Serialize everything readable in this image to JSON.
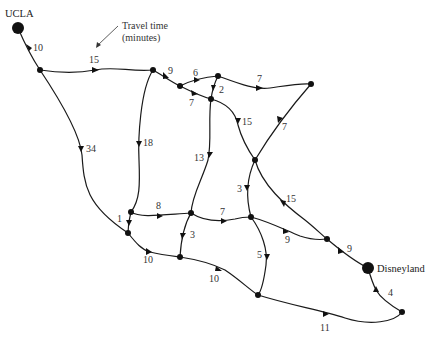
{
  "diagram": {
    "type": "directed-network",
    "annotation": {
      "text_line1": "Travel time",
      "text_line2": "(minutes)"
    },
    "terminals": {
      "source": "UCLA",
      "sink": "Disneyland"
    },
    "nodes": [
      {
        "id": "UCLA",
        "x": 18,
        "y": 28,
        "terminal": true
      },
      {
        "id": "A",
        "x": 40,
        "y": 70
      },
      {
        "id": "B",
        "x": 153,
        "y": 70
      },
      {
        "id": "C",
        "x": 180,
        "y": 86
      },
      {
        "id": "D",
        "x": 218,
        "y": 76
      },
      {
        "id": "E",
        "x": 211,
        "y": 99
      },
      {
        "id": "F",
        "x": 311,
        "y": 84
      },
      {
        "id": "G",
        "x": 255,
        "y": 160
      },
      {
        "id": "H",
        "x": 131,
        "y": 212
      },
      {
        "id": "I",
        "x": 128,
        "y": 233
      },
      {
        "id": "J",
        "x": 191,
        "y": 213
      },
      {
        "id": "K",
        "x": 180,
        "y": 257
      },
      {
        "id": "L",
        "x": 251,
        "y": 217
      },
      {
        "id": "M",
        "x": 327,
        "y": 239
      },
      {
        "id": "Disneyland",
        "x": 368,
        "y": 268,
        "terminal": true
      },
      {
        "id": "N",
        "x": 258,
        "y": 295
      },
      {
        "id": "O",
        "x": 402,
        "y": 312
      }
    ],
    "edges": [
      {
        "from": "UCLA",
        "to": "A",
        "time": "10"
      },
      {
        "from": "A",
        "to": "B",
        "time": "15"
      },
      {
        "from": "A",
        "to": "I",
        "time": "34"
      },
      {
        "from": "B",
        "to": "C",
        "time": "9"
      },
      {
        "from": "B",
        "to": "H",
        "time": "18"
      },
      {
        "from": "C",
        "to": "D",
        "time": "6"
      },
      {
        "from": "C",
        "to": "E",
        "time": "7"
      },
      {
        "from": "D",
        "to": "E",
        "time": "2"
      },
      {
        "from": "D",
        "to": "F",
        "time": "7"
      },
      {
        "from": "F",
        "to": "G",
        "time": "7"
      },
      {
        "from": "E",
        "to": "G",
        "time": "15"
      },
      {
        "from": "E",
        "to": "J",
        "time": "13"
      },
      {
        "from": "G",
        "to": "L",
        "time": "3"
      },
      {
        "from": "G",
        "to": "M",
        "time": "15"
      },
      {
        "from": "H",
        "to": "I",
        "time": "1"
      },
      {
        "from": "H",
        "to": "J",
        "time": "8"
      },
      {
        "from": "J",
        "to": "L",
        "time": "7"
      },
      {
        "from": "J",
        "to": "K",
        "time": "3"
      },
      {
        "from": "I",
        "to": "K",
        "time": "10"
      },
      {
        "from": "K",
        "to": "N",
        "time": "10"
      },
      {
        "from": "L",
        "to": "M",
        "time": "9"
      },
      {
        "from": "L",
        "to": "N",
        "time": "5"
      },
      {
        "from": "M",
        "to": "Disneyland",
        "time": "9"
      },
      {
        "from": "N",
        "to": "O",
        "time": "11"
      },
      {
        "from": "O",
        "to": "Disneyland",
        "time": "4"
      }
    ]
  },
  "labels": {
    "ucla": "UCLA",
    "disneyland": "Disneyland",
    "legend1": "Travel time",
    "legend2": "(minutes)",
    "e_ucla_a": "10",
    "e_a_b": "15",
    "e_a_i": "34",
    "e_b_c": "9",
    "e_b_h": "18",
    "e_c_d": "6",
    "e_c_e": "7",
    "e_d_e": "2",
    "e_d_f": "7",
    "e_f_g": "7",
    "e_e_g": "15",
    "e_e_j": "13",
    "e_g_l": "3",
    "e_g_m": "15",
    "e_h_i": "1",
    "e_h_j": "8",
    "e_j_l": "7",
    "e_j_k": "3",
    "e_i_k": "10",
    "e_k_n": "10",
    "e_l_m": "9",
    "e_l_n": "5",
    "e_m_dl": "9",
    "e_n_o": "11",
    "e_o_dl": "4"
  }
}
